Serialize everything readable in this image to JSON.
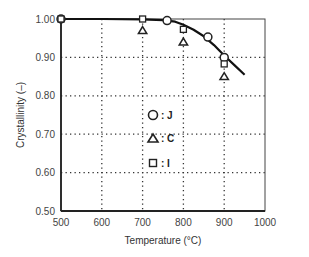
{
  "chart_data": {
    "type": "scatter",
    "title": "",
    "xlabel": "Temperature (°C)",
    "ylabel": "Crystallinity (–)",
    "xlim": [
      500,
      1000
    ],
    "ylim": [
      0.5,
      1.0
    ],
    "xticks": [
      500,
      600,
      700,
      800,
      900,
      1000
    ],
    "xtick_labels": [
      "500",
      "600",
      "700",
      "800",
      "900",
      "1000"
    ],
    "yticks": [
      0.5,
      0.6,
      0.7,
      0.8,
      0.9,
      1.0
    ],
    "ytick_labels": [
      "0.50",
      "0.60",
      "0.70",
      "0.80",
      "0.90",
      "1.00"
    ],
    "grid": "dotted",
    "legend_position": "center",
    "series": [
      {
        "name": "J",
        "marker": "circle",
        "x": [
          500,
          760,
          860,
          900
        ],
        "y": [
          1.0,
          0.996,
          0.953,
          0.9
        ]
      },
      {
        "name": "C",
        "marker": "triangle",
        "x": [
          700,
          800,
          900
        ],
        "y": [
          0.97,
          0.94,
          0.85
        ]
      },
      {
        "name": "I",
        "marker": "square",
        "x": [
          500,
          700,
          800,
          900
        ],
        "y": [
          1.0,
          1.0,
          0.973,
          0.883
        ]
      }
    ],
    "fit_curve": {
      "name": "fit",
      "x": [
        500,
        600,
        700,
        750,
        780,
        800,
        825,
        850,
        875,
        900,
        925,
        950
      ],
      "y": [
        1.0,
        1.0,
        0.999,
        0.997,
        0.993,
        0.985,
        0.972,
        0.955,
        0.932,
        0.905,
        0.88,
        0.855
      ]
    },
    "legend": [
      {
        "marker": "circle",
        "label": ": J"
      },
      {
        "marker": "triangle",
        "label": ": C"
      },
      {
        "marker": "square",
        "label": ": I"
      }
    ]
  }
}
